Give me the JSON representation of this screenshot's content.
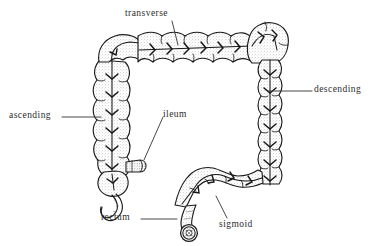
{
  "figure": {
    "background_color": "#ffffff",
    "ink_color": "#1a1a1a",
    "label_color": "#2b2b2b",
    "stipple_color": "#9a9a9a"
  },
  "labels": {
    "transverse": "transverse",
    "descending": "descending",
    "ascending": "ascending",
    "ileum": "ileum",
    "rectum": "rectum",
    "sigmoid": "sigmoid"
  },
  "parts": {
    "transverse_colon": "transverse-colon",
    "descending_colon": "descending-colon",
    "ascending_colon": "ascending-colon",
    "ileum_stub": "ileum-stub",
    "cecum": "cecum",
    "appendix": "appendix",
    "sigmoid_colon": "sigmoid-colon",
    "rectum_tube": "rectum",
    "anal_opening": "anal-opening",
    "hepatic_flexure": "hepatic-flexure",
    "splenic_flexure": "splenic-flexure"
  }
}
